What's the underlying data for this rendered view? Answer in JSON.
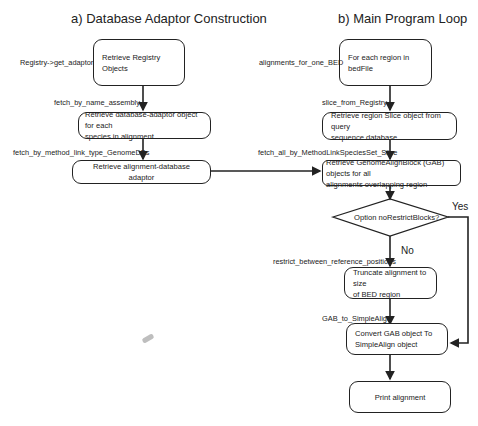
{
  "panel_a": {
    "title": "a) Database Adaptor Construction",
    "steps": [
      {
        "text": "Retrieve Registry Objects",
        "line1": "Retrieve Registry",
        "line2": "Objects",
        "method": "Registry->get_adaptor"
      },
      {
        "text": "Retrieve database-adaptor object for each species in alignment",
        "line1": "Retrieve database-adaptor object for each",
        "line2": "species in alignment",
        "method": "fetch_by_name_assembly"
      },
      {
        "text": "Retrieve alignment-database adaptor",
        "line1": "Retrieve alignment-database adaptor",
        "method": "fetch_by_method_link_type_GenomeDBs"
      }
    ]
  },
  "panel_b": {
    "title": "b) Main Program Loop",
    "steps": [
      {
        "line1": "For each region in",
        "line2": "bedFile",
        "method": "alignments_for_one_BED"
      },
      {
        "line1": "Retrieve region Slice object from query",
        "line2": "sequence database",
        "method": "slice_from_Registry"
      },
      {
        "line1": "Retrieve GenomeAlignBlock (GAB) objects for all",
        "line2": "alignments overlapping region",
        "method": "fetch_all_by_MethodLinkSpeciesSet_Slice"
      },
      {
        "line1": "Truncate alignment to size",
        "line2": "of BED region",
        "method": "restrict_between_reference_positions"
      },
      {
        "line1": "Convert GAB object To",
        "line2": "SimpleAlign object",
        "method": "GAB_to_SimpleAlign"
      },
      {
        "line1": "Print alignment"
      }
    ],
    "decision": {
      "text": "Option noRestrictBlocks?",
      "yes_label": "Yes",
      "no_label": "No"
    }
  }
}
